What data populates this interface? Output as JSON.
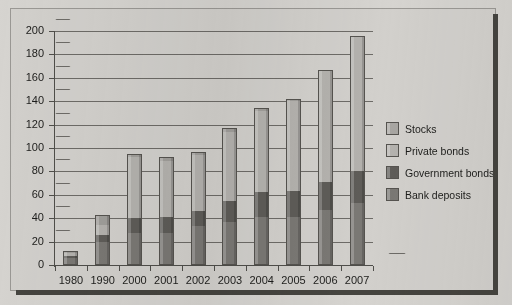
{
  "chart_data": {
    "type": "bar",
    "subtype": "stacked-column",
    "title": "",
    "xlabel": "",
    "ylabel": "",
    "ylim": [
      0,
      200
    ],
    "ytick_step": 20,
    "yticks": [
      0,
      20,
      40,
      60,
      80,
      100,
      120,
      140,
      160,
      180,
      200
    ],
    "grid": true,
    "legend_position": "right",
    "categories": [
      "1980",
      "1990",
      "2000",
      "2001",
      "2002",
      "2003",
      "2004",
      "2005",
      "2006",
      "2007"
    ],
    "series": [
      {
        "name": "Bank deposits",
        "color": "#7a7874",
        "values": [
          6,
          20,
          27,
          27,
          33,
          37,
          41,
          41,
          47,
          53
        ]
      },
      {
        "name": "Government bonds",
        "color": "#5e5c58",
        "values": [
          2,
          6,
          13,
          14,
          13,
          18,
          21,
          22,
          24,
          27
        ]
      },
      {
        "name": "Private bonds",
        "color": "#b4b2ae",
        "values": [
          2,
          8,
          52,
          48,
          48,
          59,
          70,
          77,
          95,
          115
        ]
      },
      {
        "name": "Stocks",
        "color": "#a09e9a",
        "values": [
          2,
          9,
          3,
          3,
          3,
          3,
          2,
          2,
          1,
          1
        ]
      }
    ],
    "totals": [
      12,
      43,
      95,
      92,
      97,
      117,
      134,
      142,
      167,
      196
    ]
  },
  "legend": {
    "items": [
      {
        "label": "Stocks",
        "color": "#a8a6a2"
      },
      {
        "label": "Private bonds",
        "color": "#b4b2ae"
      },
      {
        "label": "Government bonds",
        "color": "#5e5c58"
      },
      {
        "label": "Bank deposits",
        "color": "#7a7874"
      }
    ]
  }
}
